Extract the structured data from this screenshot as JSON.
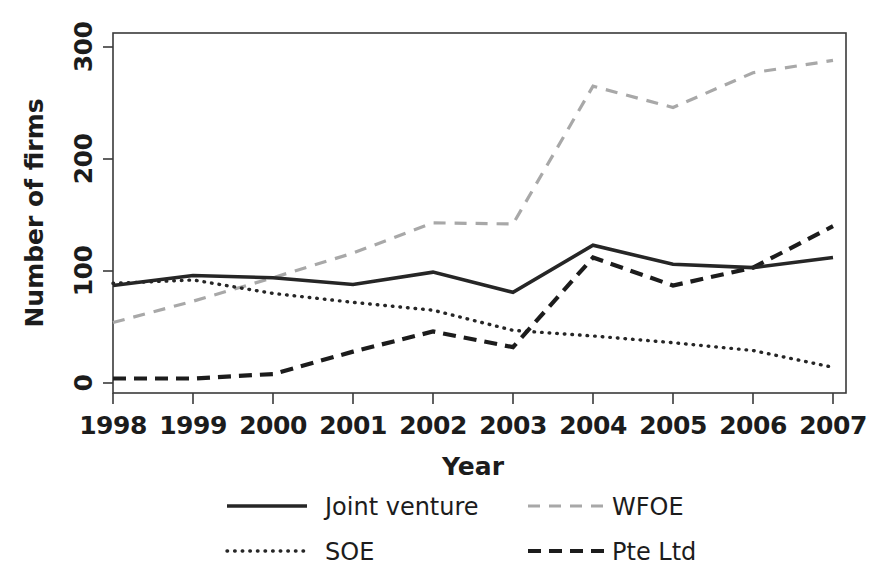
{
  "chart_data": {
    "type": "line",
    "title": "",
    "xlabel": "Year",
    "ylabel": "Number of firms",
    "x": [
      "1998",
      "1999",
      "2000",
      "2001",
      "2002",
      "2003",
      "2004",
      "2005",
      "2006",
      "2007"
    ],
    "categories": [
      "1998",
      "1999",
      "2000",
      "2001",
      "2002",
      "2003",
      "2004",
      "2005",
      "2006",
      "2007"
    ],
    "xlim": [
      1998,
      2007
    ],
    "ylim": [
      0,
      300
    ],
    "yticks": [
      0,
      100,
      200,
      300
    ],
    "ytick_labels": [
      "0",
      "100",
      "200",
      "300"
    ],
    "grid": false,
    "legend_position": "bottom",
    "series": [
      {
        "name": "Joint venture",
        "style": "solid",
        "color": "#262626",
        "values": [
          87,
          96,
          94,
          88,
          99,
          81,
          123,
          106,
          103,
          112
        ]
      },
      {
        "name": "WFOE",
        "style": "dashed",
        "color": "#a8a8a8",
        "values": [
          54,
          73,
          94,
          116,
          143,
          142,
          265,
          246,
          277,
          288
        ]
      },
      {
        "name": "SOE",
        "style": "dotted",
        "color": "#262626",
        "values": [
          89,
          92,
          80,
          72,
          65,
          47,
          42,
          36,
          29,
          14
        ]
      },
      {
        "name": "Pte Ltd",
        "style": "dashed-bold",
        "color": "#1c1c1c",
        "values": [
          4,
          4,
          8,
          28,
          46,
          32,
          112,
          87,
          103,
          140
        ]
      }
    ]
  },
  "axes": {
    "y_title": "Number of firms",
    "x_title": "Year",
    "y_ticks": [
      {
        "label": "300",
        "value": 300
      },
      {
        "label": "200",
        "value": 200
      },
      {
        "label": "100",
        "value": 100
      },
      {
        "label": "0",
        "value": 0
      }
    ],
    "x_ticks": [
      {
        "label": "1998"
      },
      {
        "label": "1999"
      },
      {
        "label": "2000"
      },
      {
        "label": "2001"
      },
      {
        "label": "2002"
      },
      {
        "label": "2003"
      },
      {
        "label": "2004"
      },
      {
        "label": "2005"
      },
      {
        "label": "2006"
      },
      {
        "label": "2007"
      }
    ]
  },
  "legend": {
    "entries": [
      {
        "label": "Joint venture",
        "style": "solid",
        "color": "#262626"
      },
      {
        "label": "WFOE",
        "style": "dashed",
        "color": "#a8a8a8"
      },
      {
        "label": "SOE",
        "style": "dotted",
        "color": "#262626"
      },
      {
        "label": "Pte Ltd",
        "style": "dashed-bold",
        "color": "#1c1c1c"
      }
    ]
  },
  "colors": {
    "axis": "#3a3a3a",
    "text": "#1c1c1c",
    "background": "#ffffff",
    "joint_venture": "#262626",
    "wfoe": "#a8a8a8",
    "soe": "#262626",
    "pte_ltd": "#1c1c1c"
  }
}
